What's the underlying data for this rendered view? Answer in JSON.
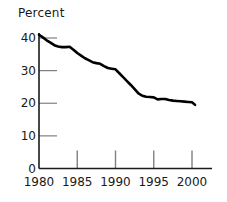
{
  "chart_data": {
    "type": "line",
    "title": "Percent",
    "xlabel": "",
    "ylabel": "Percent",
    "xlim": [
      1980,
      2001
    ],
    "ylim": [
      0,
      42
    ],
    "grid": false,
    "legend": null,
    "y_ticks": [
      0,
      10,
      20,
      30,
      40
    ],
    "y_tick_labels": [
      "0",
      "10",
      "20",
      "30",
      "40"
    ],
    "x_ticks": [
      1980,
      1985,
      1990,
      1995,
      2000
    ],
    "x_tick_labels": [
      "1980",
      "1985",
      "1990",
      "1995",
      "2000"
    ],
    "line_color": "#000000",
    "axis_color": "#1a1a1a",
    "tick_color": "#808080",
    "series": [
      {
        "name": "Percent",
        "x": [
          1980,
          1980.5,
          1981,
          1981.5,
          1982,
          1982.5,
          1983,
          1983.5,
          1984,
          1984.5,
          1985,
          1985.5,
          1986,
          1986.5,
          1987,
          1987.5,
          1988,
          1988.5,
          1989,
          1989.5,
          1990,
          1990.5,
          1991,
          1991.5,
          1992,
          1992.5,
          1993,
          1993.5,
          1994,
          1994.5,
          1995,
          1995.5,
          1996,
          1996.5,
          1997,
          1997.5,
          1998,
          1998.5,
          1999,
          1999.5,
          2000,
          2000.4
        ],
        "values": [
          41.0,
          40.2,
          39.3,
          38.6,
          37.8,
          37.4,
          37.2,
          37.2,
          37.3,
          36.4,
          35.4,
          34.6,
          33.8,
          33.2,
          32.6,
          32.3,
          32.1,
          31.4,
          30.8,
          30.6,
          30.4,
          29.2,
          28.0,
          26.8,
          25.6,
          24.3,
          23.0,
          22.3,
          22.0,
          21.9,
          21.8,
          21.2,
          21.3,
          21.3,
          21.0,
          20.8,
          20.7,
          20.6,
          20.5,
          20.4,
          20.3,
          19.5
        ]
      }
    ]
  }
}
